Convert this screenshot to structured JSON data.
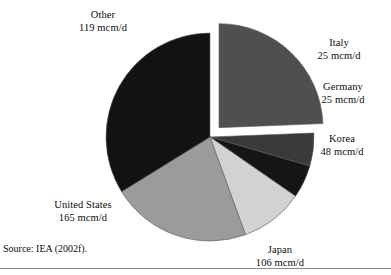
{
  "figure": {
    "source_note": "Source: IEA (2002f).",
    "units": "mcm/d"
  },
  "chart_data": {
    "type": "pie",
    "title": "",
    "subtitle": "",
    "xlabel": "",
    "ylabel": "",
    "legend": "none",
    "grid": false,
    "unit": "mcm/d",
    "total": 488,
    "exploded_slices": [
      "Other"
    ],
    "start_angle_deg": -90,
    "direction": "clockwise",
    "categories": [
      "Other",
      "Italy",
      "Germany",
      "Korea",
      "Japan",
      "United States"
    ],
    "values": [
      119,
      25,
      25,
      48,
      106,
      165
    ],
    "labels": [
      "Other\n119 mcm/d",
      "Italy\n25 mcm/d",
      "Germany\n25 mcm/d",
      "Korea\n48 mcm/d",
      "Japan\n106 mcm/d",
      "United States\n165 mcm/d"
    ],
    "colors": [
      "#4f4f4f",
      "#3a3a3a",
      "#151515",
      "#d2d2d2",
      "#9b9b9b",
      "#121212"
    ],
    "slices": [
      {
        "name": "Other",
        "value": 119,
        "value_label": "119 mcm/d",
        "color": "#4f4f4f",
        "exploded": true
      },
      {
        "name": "Italy",
        "value": 25,
        "value_label": "25 mcm/d",
        "color": "#3a3a3a",
        "exploded": false
      },
      {
        "name": "Germany",
        "value": 25,
        "value_label": "25 mcm/d",
        "color": "#151515",
        "exploded": false
      },
      {
        "name": "Korea",
        "value": 48,
        "value_label": "48 mcm/d",
        "color": "#d2d2d2",
        "exploded": false
      },
      {
        "name": "Japan",
        "value": 106,
        "value_label": "106 mcm/d",
        "color": "#9b9b9b",
        "exploded": false
      },
      {
        "name": "United States",
        "value": 165,
        "value_label": "165 mcm/d",
        "color": "#121212",
        "exploded": false
      }
    ]
  },
  "labels": {
    "other": {
      "name": "Other",
      "value": "119 mcm/d"
    },
    "italy": {
      "name": "Italy",
      "value": "25 mcm/d"
    },
    "germany": {
      "name": "Germany",
      "value": "25 mcm/d"
    },
    "korea": {
      "name": "Korea",
      "value": "48 mcm/d"
    },
    "japan": {
      "name": "Japan",
      "value": "106 mcm/d"
    },
    "us": {
      "name": "United States",
      "value": "165 mcm/d"
    }
  }
}
